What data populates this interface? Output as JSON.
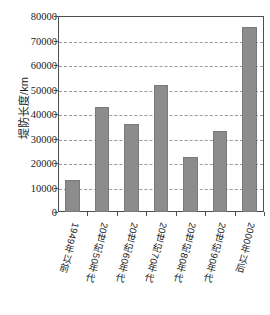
{
  "chart_data": {
    "type": "bar",
    "title": "",
    "xlabel": "",
    "ylabel": "堤防长度/km",
    "categories": [
      "1949年以前",
      "20世纪50年代",
      "20世纪60年代",
      "20世纪70年代",
      "20世纪80年代",
      "20世纪90年代",
      "2000年以后"
    ],
    "values": [
      13000,
      43000,
      36000,
      52000,
      22500,
      33000,
      75500
    ],
    "ylim": [
      0,
      80000
    ],
    "ytick_labels": [
      "0",
      "10000",
      "20000",
      "30000",
      "40000",
      "50000",
      "60000",
      "70000",
      "80000"
    ],
    "ytick_values": [
      0,
      10000,
      20000,
      30000,
      40000,
      50000,
      60000,
      70000,
      80000
    ],
    "grid": true,
    "legend": "none",
    "bar_color": "#8c8c8c",
    "axis_color": "#4d4d4d",
    "grid_color": "#9a9a9a"
  }
}
